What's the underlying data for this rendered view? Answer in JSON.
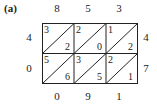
{
  "label": "(a)",
  "top_digits": [
    "8",
    "5",
    "3"
  ],
  "left_digits": [
    "4",
    "0"
  ],
  "right_digits": [
    "4",
    "7"
  ],
  "bottom_digits": [
    "0",
    "9",
    "1"
  ],
  "cells": [
    [
      {
        "tl": "3",
        "br": "2"
      },
      {
        "tl": "2",
        "br": "0"
      },
      {
        "tl": "1",
        "br": "2"
      }
    ],
    [
      {
        "tl": "5",
        "br": "6"
      },
      {
        "tl": "3",
        "br": "5"
      },
      {
        "tl": "2",
        "br": "1"
      }
    ]
  ],
  "colors": {
    "line": "#222222",
    "text": "#222222",
    "background": "#ffffff"
  }
}
